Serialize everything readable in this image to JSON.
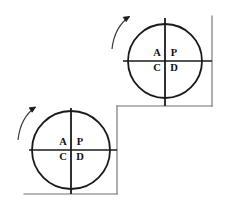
{
  "figure": {
    "colors": {
      "stroke": "#1a1a1a",
      "frame_stroke": "#6e6e6e",
      "text": "#111111",
      "background": "#ffffff"
    },
    "shapes": [
      {
        "id": "upper",
        "name": "upper-circle-figure",
        "cx": 165,
        "cy": 61,
        "r": 37,
        "quadrants": {
          "top_left": "A",
          "top_right": "P",
          "bottom_left": "C",
          "bottom_right": "D"
        },
        "rotation_arrow": "counterclockwise"
      },
      {
        "id": "lower",
        "name": "lower-circle-figure",
        "cx": 71,
        "cy": 150,
        "r": 39,
        "quadrants": {
          "top_left": "A",
          "top_right": "P",
          "bottom_left": "C",
          "bottom_right": "D"
        },
        "rotation_arrow": "counterclockwise"
      }
    ],
    "frame": {
      "name": "stepped-baseline",
      "segments": [
        "right-vertical",
        "upper-horizontal",
        "middle-vertical",
        "lower-horizontal"
      ]
    }
  }
}
